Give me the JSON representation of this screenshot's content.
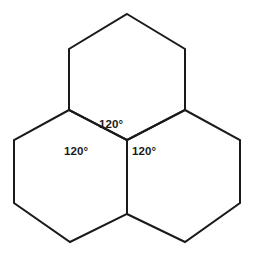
{
  "figure": {
    "name": "three-hexagon-tessellation",
    "background_color": "#ffffff",
    "stroke_color": "#1a1a1a",
    "stroke_width": 2,
    "width": 254,
    "height": 258
  },
  "labels": {
    "top_angle": "120°",
    "left_angle": "120°",
    "right_angle": "120°"
  },
  "chart_data": {
    "type": "diagram",
    "title": "",
    "shapes": [
      {
        "name": "top-hexagon",
        "vertices": [
          [
            127,
            14
          ],
          [
            185,
            49
          ],
          [
            185,
            110
          ],
          [
            127,
            140
          ],
          [
            69,
            110
          ],
          [
            69,
            49
          ]
        ]
      },
      {
        "name": "lower-left-hexagon",
        "vertices": [
          [
            69,
            110
          ],
          [
            127,
            140
          ],
          [
            127,
            214
          ],
          [
            70,
            242
          ],
          [
            14,
            203
          ],
          [
            14,
            140
          ]
        ]
      },
      {
        "name": "lower-right-hexagon",
        "vertices": [
          [
            185,
            110
          ],
          [
            240,
            140
          ],
          [
            240,
            203
          ],
          [
            185,
            242
          ],
          [
            127,
            214
          ],
          [
            127,
            140
          ]
        ]
      }
    ],
    "central_vertex": [
      127,
      140
    ],
    "angle_labels": [
      {
        "text": "120°",
        "position": [
          99,
          119
        ],
        "belongs_to": "top-hexagon"
      },
      {
        "text": "120°",
        "position": [
          64,
          146
        ],
        "belongs_to": "lower-left-hexagon"
      },
      {
        "text": "120°",
        "position": [
          132,
          146
        ],
        "belongs_to": "lower-right-hexagon"
      }
    ],
    "angle_sum": 360
  }
}
